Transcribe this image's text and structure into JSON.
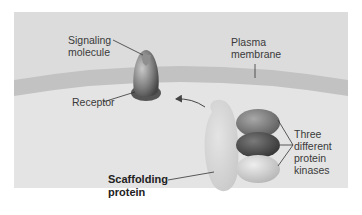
{
  "diagram": {
    "type": "biology-schematic",
    "labels": {
      "signaling_molecule": [
        "Signaling",
        "molecule"
      ],
      "plasma_membrane": [
        "Plasma",
        "membrane"
      ],
      "receptor": "Receptor",
      "three_kinases": [
        "Three",
        "different",
        "protein",
        "kinases"
      ],
      "scaffolding_protein": [
        "Scaffolding",
        "protein"
      ]
    },
    "colors": {
      "panel_background": "#dcdcdc",
      "cytoplasm": "#e6e6e6",
      "membrane_band": "#c4c4c4",
      "receptor_dark": "#5e5e5e",
      "receptor_light": "#b8b8b8",
      "scaffold": "#d6d6d6",
      "kinase_top": "#7d7d7d",
      "kinase_middle": "#555555",
      "kinase_bottom": "#cfcfcf",
      "leader_lines": "#333333"
    }
  }
}
